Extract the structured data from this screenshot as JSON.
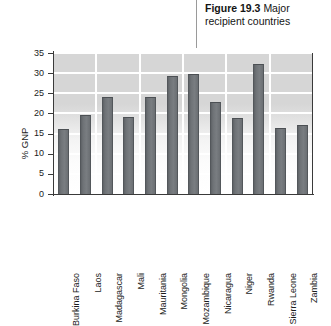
{
  "caption": {
    "figure_number": "Figure 19.3",
    "text": "Major recipient countries"
  },
  "chart_data": {
    "type": "bar",
    "title": "Major recipient countries",
    "xlabel": "",
    "ylabel": "% GNP",
    "ylim": [
      0,
      35
    ],
    "ytick_labels": [
      "0",
      "5",
      "10",
      "15",
      "20",
      "25",
      "30",
      "35"
    ],
    "yticks": [
      0,
      5,
      10,
      15,
      20,
      25,
      30,
      35
    ],
    "grid": true,
    "legend": false,
    "bar_color": "#6e7276",
    "plot_background": "#d6d6d6",
    "gridline_color": "#ffffff",
    "categories": [
      "Burkina Faso",
      "Laos",
      "Madagascar",
      "Mali",
      "Mauritania",
      "Mongolia",
      "Mozambique",
      "Nicaragua",
      "Niger",
      "Rwanda",
      "Sierra Leone",
      "Zambia"
    ],
    "values": [
      16.2,
      19.5,
      24.2,
      19.2,
      24.2,
      29.2,
      29.8,
      22.9,
      18.8,
      32.2,
      16.3,
      17.1
    ]
  }
}
